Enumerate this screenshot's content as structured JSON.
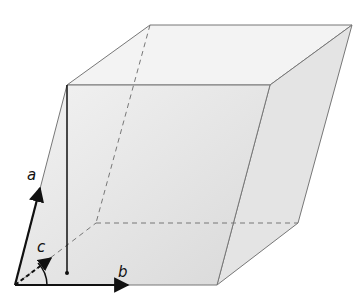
{
  "diagram": {
    "type": "unit-cell-parallelepiped",
    "vectors": [
      {
        "name": "a",
        "label": "a"
      },
      {
        "name": "b",
        "label": "b"
      },
      {
        "name": "c",
        "label": "c"
      }
    ],
    "colors": {
      "face_fill": "#e6e6e6",
      "edge": "#777777",
      "vector": "#111111"
    }
  }
}
